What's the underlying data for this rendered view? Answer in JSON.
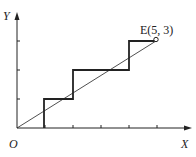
{
  "diagram": {
    "axes": {
      "x_label": "X",
      "y_label": "Y",
      "origin_label": "O",
      "x_ticks": [
        1,
        2,
        3,
        4,
        5
      ],
      "y_ticks": [
        1,
        2,
        3
      ]
    },
    "point": {
      "name": "E",
      "label": "E(5, 3)",
      "x": 5,
      "y": 3
    },
    "staircase_path": [
      [
        1,
        0
      ],
      [
        1,
        1
      ],
      [
        2,
        1
      ],
      [
        2,
        2
      ],
      [
        4,
        2
      ],
      [
        4,
        3
      ],
      [
        5,
        3
      ]
    ],
    "line": {
      "from": [
        0,
        0
      ],
      "to": [
        5,
        3
      ]
    },
    "colors": {
      "stroke": "#222222",
      "background": "#ffffff"
    }
  }
}
